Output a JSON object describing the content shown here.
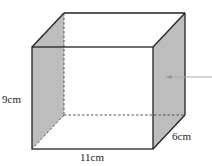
{
  "diagram": {
    "type": "cuboid",
    "labels": {
      "height": "9cm",
      "length": "11cm",
      "depth": "6cm"
    },
    "colors": {
      "shaded_face": "#b8b8b8",
      "edge": "#222222",
      "arrow": "#999999"
    }
  }
}
